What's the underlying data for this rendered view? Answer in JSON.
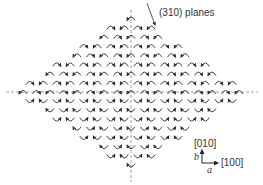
{
  "diagram": {
    "type": "crystal-lattice-orientation-map",
    "region_shape": "diamond",
    "element_glyph": "curved-arrow",
    "colors": {
      "arrow": "#333333",
      "axis_dashed": "#888888",
      "text": "#333333",
      "background": "#ffffff"
    },
    "labels": {
      "planes": "(310) planes",
      "dir_010": "[010]",
      "dir_100": "[100]",
      "axis_b": "b",
      "axis_a": "a"
    }
  }
}
